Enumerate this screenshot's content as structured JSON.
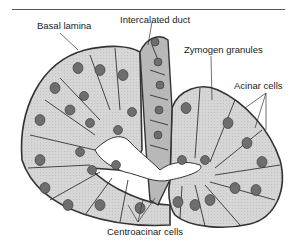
{
  "figure": {
    "labels": {
      "basal_lamina": "Basal lamina",
      "intercalated_duct": "Intercalated duct",
      "zymogen_granules": "Zymogen granules",
      "acinar_cells": "Acinar cells",
      "centroacinar_cells": "Centroacinar cells"
    },
    "colors": {
      "acinar_cell_fill": "#d4d4d4",
      "duct_cell_fill": "#b3b3b3",
      "nucleus_fill": "#6e6e6e",
      "outline": "#333333",
      "lumen": "#ffffff"
    }
  }
}
